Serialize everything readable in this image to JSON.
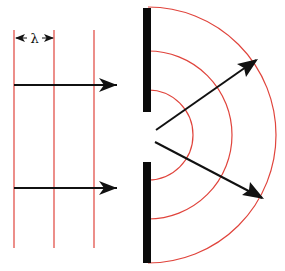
{
  "diagram": {
    "colors": {
      "wavefront": "#e0443c",
      "barrier": "#0a0a0a",
      "arrow": "#111111",
      "background": "#ffffff"
    },
    "wavelength_label": "λ",
    "incident_wavefronts": [
      {
        "x": 14,
        "y1": 30,
        "y2": 248
      },
      {
        "x": 54,
        "y1": 30,
        "y2": 248
      },
      {
        "x": 94,
        "y1": 30,
        "y2": 248
      }
    ],
    "barrier": {
      "x": 143,
      "width": 8,
      "top_segment": {
        "y1": 8,
        "y2": 112
      },
      "bottom_segment": {
        "y1": 162,
        "y2": 263
      }
    },
    "diffracted_wavefronts": {
      "center": {
        "x": 148,
        "y": 135
      },
      "radii": [
        45,
        84,
        128
      ]
    },
    "arrows": [
      {
        "name": "incident-arrow-top",
        "x1": 14,
        "y1": 85,
        "x2": 118,
        "y2": 85
      },
      {
        "name": "incident-arrow-bottom",
        "x1": 14,
        "y1": 188,
        "x2": 118,
        "y2": 188
      },
      {
        "name": "diffracted-arrow-up",
        "x1": 156,
        "y1": 130,
        "x2": 258,
        "y2": 59
      },
      {
        "name": "diffracted-arrow-down",
        "x1": 155,
        "y1": 142,
        "x2": 264,
        "y2": 199
      }
    ]
  }
}
